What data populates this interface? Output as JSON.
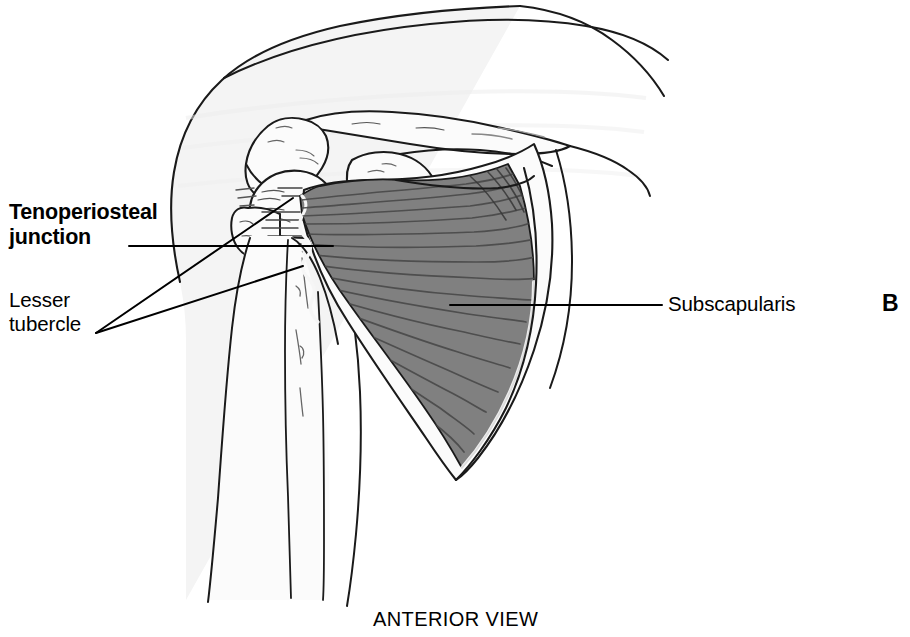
{
  "figure": {
    "panel_label": "B",
    "caption": "ANTERIOR VIEW",
    "view": "anterior"
  },
  "labels": {
    "tenoperiosteal_line1": "Tenoperiosteal",
    "tenoperiosteal_line2": "junction",
    "lesser_line1": "Lesser",
    "lesser_line2": "tubercle",
    "subscapularis": "Subscapularis"
  },
  "colors": {
    "outline": "#1a1a1a",
    "muscle_fill": "#808080",
    "muscle_striation": "#4a4a4a",
    "bone_fill": "#fbfbfb",
    "soft_tissue_fill": "#f4f4f4",
    "background": "#ffffff",
    "text": "#000000"
  },
  "structures": [
    {
      "name": "deltoid-soft-tissue",
      "kind": "soft-tissue"
    },
    {
      "name": "clavicle",
      "kind": "bone"
    },
    {
      "name": "acromion",
      "kind": "bone"
    },
    {
      "name": "coracoid-process",
      "kind": "bone"
    },
    {
      "name": "humeral-head",
      "kind": "bone"
    },
    {
      "name": "lesser-tubercle",
      "kind": "bone"
    },
    {
      "name": "humerus-shaft",
      "kind": "bone"
    },
    {
      "name": "scapula",
      "kind": "bone"
    },
    {
      "name": "subscapularis-muscle",
      "kind": "muscle"
    },
    {
      "name": "tenoperiosteal-junction",
      "kind": "insertion"
    }
  ],
  "leaders": [
    {
      "name": "leader-tenoperiosteal",
      "from": "junction label",
      "to": "tendon insertion on lesser tubercle"
    },
    {
      "name": "leader-lesser-upper",
      "from": "lesser tubercle label",
      "to": "upper tubercle point"
    },
    {
      "name": "leader-lesser-lower",
      "from": "lesser tubercle label",
      "to": "lower tubercle point"
    },
    {
      "name": "leader-subscapularis",
      "from": "subscapularis label",
      "to": "muscle belly"
    }
  ]
}
